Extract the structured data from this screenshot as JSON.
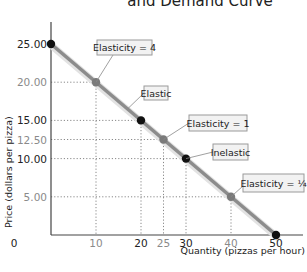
{
  "chart_data": {
    "type": "line",
    "title": "and Demand Curve",
    "xlabel": "Quantity (pizzas per hour)",
    "ylabel": "Price (dollars per pizza)",
    "xlim": [
      0,
      50
    ],
    "ylim": [
      0,
      25
    ],
    "grid": false,
    "x_ticks": [
      {
        "value": 0,
        "label": "0",
        "emphasis": "dark"
      },
      {
        "value": 10,
        "label": "10",
        "emphasis": "light"
      },
      {
        "value": 20,
        "label": "20",
        "emphasis": "dark"
      },
      {
        "value": 25,
        "label": "25",
        "emphasis": "light"
      },
      {
        "value": 30,
        "label": "30",
        "emphasis": "dark"
      },
      {
        "value": 40,
        "label": "40",
        "emphasis": "light"
      },
      {
        "value": 50,
        "label": "50",
        "emphasis": "dark"
      }
    ],
    "y_ticks": [
      {
        "value": 25,
        "label": "25.00",
        "emphasis": "dark"
      },
      {
        "value": 20,
        "label": "20.00",
        "emphasis": "light"
      },
      {
        "value": 15,
        "label": "15.00",
        "emphasis": "dark"
      },
      {
        "value": 12.5,
        "label": "12.50",
        "emphasis": "light"
      },
      {
        "value": 10,
        "label": "10.00",
        "emphasis": "dark"
      },
      {
        "value": 5,
        "label": "5.00",
        "emphasis": "light"
      }
    ],
    "series": [
      {
        "name": "Demand",
        "x": [
          0,
          50
        ],
        "y": [
          25,
          0
        ],
        "color": "#8c8c8c"
      }
    ],
    "points": [
      {
        "x": 0,
        "y": 25,
        "color": "#111111"
      },
      {
        "x": 10,
        "y": 20,
        "color": "#7a7a7a"
      },
      {
        "x": 20,
        "y": 15,
        "color": "#111111"
      },
      {
        "x": 25,
        "y": 12.5,
        "color": "#7a7a7a"
      },
      {
        "x": 30,
        "y": 10,
        "color": "#111111"
      },
      {
        "x": 40,
        "y": 5,
        "color": "#7a7a7a"
      },
      {
        "x": 50,
        "y": 0,
        "color": "#111111"
      }
    ],
    "annotations": [
      {
        "text": "Elasticity = 4",
        "target": [
          10,
          20
        ]
      },
      {
        "text": "Elastic",
        "target": [
          17,
          16.5
        ]
      },
      {
        "text": "Elasticity = 1",
        "target": [
          25,
          12.5
        ]
      },
      {
        "text": "Inelastic",
        "target": [
          30,
          10
        ]
      },
      {
        "text": "Elasticity = ¼",
        "target": [
          40,
          5
        ]
      }
    ]
  },
  "colors": {
    "curve": "#8c8c8c",
    "axis": "#444444",
    "grid": "#888888",
    "callout_fill": "#f2f2f2",
    "callout_border": "#9a9a9a"
  }
}
